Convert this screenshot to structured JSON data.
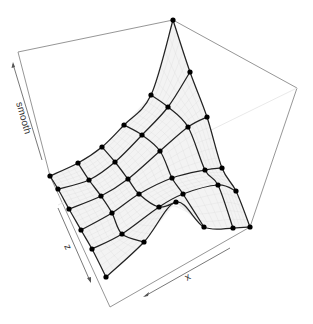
{
  "chart_data": {
    "type": "surface3d",
    "title": "",
    "axes": {
      "x": {
        "label": "x"
      },
      "y": {
        "label": "z"
      },
      "z": {
        "label": "smooth"
      }
    },
    "grid": {
      "rows": 6,
      "cols": 6,
      "description": "Smoothed surface with a ridge peaking at the back corner and dipping to a valley along the front-right edge; thick mesh lines through 6x6 control nodes over a fine grey grid."
    },
    "nodes_px": [
      [
        [
          50,
          176
        ],
        [
          78,
          163
        ],
        [
          102,
          147
        ],
        [
          124,
          125
        ],
        [
          151,
          95
        ],
        [
          173,
          20
        ]
      ],
      [
        [
          58,
          189
        ],
        [
          89,
          180
        ],
        [
          115,
          162
        ],
        [
          142,
          135
        ],
        [
          168,
          107
        ],
        [
          190,
          72
        ]
      ],
      [
        [
          69,
          209
        ],
        [
          101,
          196
        ],
        [
          128,
          179
        ],
        [
          160,
          151
        ],
        [
          188,
          127
        ],
        [
          207,
          117
        ]
      ],
      [
        [
          81,
          230
        ],
        [
          112,
          213
        ],
        [
          139,
          194
        ],
        [
          172,
          178
        ],
        [
          205,
          170
        ],
        [
          222,
          168
        ]
      ],
      [
        [
          92,
          249
        ],
        [
          122,
          234
        ],
        [
          159,
          207
        ],
        [
          183,
          194
        ],
        [
          218,
          185
        ],
        [
          236,
          191
        ]
      ],
      [
        [
          106,
          277
        ],
        [
          144,
          242
        ],
        [
          176,
          202
        ],
        [
          204,
          227
        ],
        [
          233,
          228
        ],
        [
          250,
          227
        ]
      ]
    ],
    "colors": {
      "mesh": "#222222",
      "node": "#000000",
      "box": "#8a8a8a",
      "surface": "#f3f3f3",
      "fine_grid": "#dcdcdc"
    }
  },
  "labels": {
    "x_axis": "x",
    "z_axis": "z",
    "smooth_axis": "smooth"
  }
}
